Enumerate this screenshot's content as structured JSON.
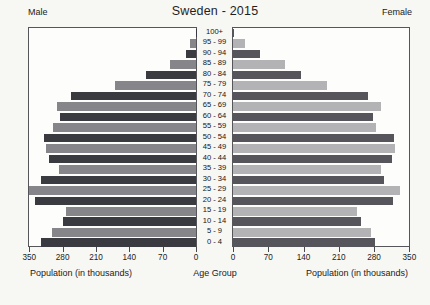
{
  "title": "Sweden - 2015",
  "left_header": "Male",
  "right_header": "Female",
  "footer": {
    "left_axis_label": "Population (in thousands)",
    "center_label": "Age Group",
    "right_axis_label": "Population (in thousands)"
  },
  "colors": {
    "male_dark": "#3a3a41",
    "male_light": "#85858a",
    "female_dark": "#55555b",
    "female_light": "#b3b3b6",
    "panel_border": "#56565a",
    "background": "#f7f7f4"
  },
  "chart_data": {
    "type": "bar",
    "subtype": "population-pyramid",
    "title": "Sweden - 2015",
    "unit": "thousands",
    "xlabel": "Population (in thousands)",
    "center_axis_label": "Age Group",
    "grid": false,
    "xlim": [
      0,
      350
    ],
    "x_ticks_left": [
      350,
      280,
      210,
      140,
      70,
      0
    ],
    "x_ticks_right": [
      0,
      70,
      140,
      210,
      280,
      350
    ],
    "categories_top_to_bottom": [
      "100+",
      "95 - 99",
      "90 - 94",
      "85 - 89",
      "80 - 84",
      "75 - 79",
      "70 - 74",
      "65 - 69",
      "60 - 64",
      "55 - 59",
      "50 - 54",
      "45 - 49",
      "40 - 44",
      "35 - 39",
      "30 - 34",
      "25 - 29",
      "20 - 24",
      "15 - 19",
      "10 - 14",
      "5 - 9",
      "0 - 4"
    ],
    "series": [
      {
        "name": "Male",
        "side": "left",
        "values": [
          1,
          13,
          21,
          55,
          105,
          170,
          262,
          292,
          286,
          300,
          320,
          316,
          309,
          288,
          325,
          350,
          339,
          272,
          279,
          302,
          326
        ]
      },
      {
        "name": "Female",
        "side": "right",
        "values": [
          2,
          24,
          53,
          103,
          134,
          187,
          268,
          293,
          278,
          284,
          319,
          321,
          315,
          294,
          299,
          331,
          317,
          247,
          253,
          273,
          281
        ]
      }
    ],
    "row_shading": "alternating dark/light per age row, 0-4 dark"
  }
}
